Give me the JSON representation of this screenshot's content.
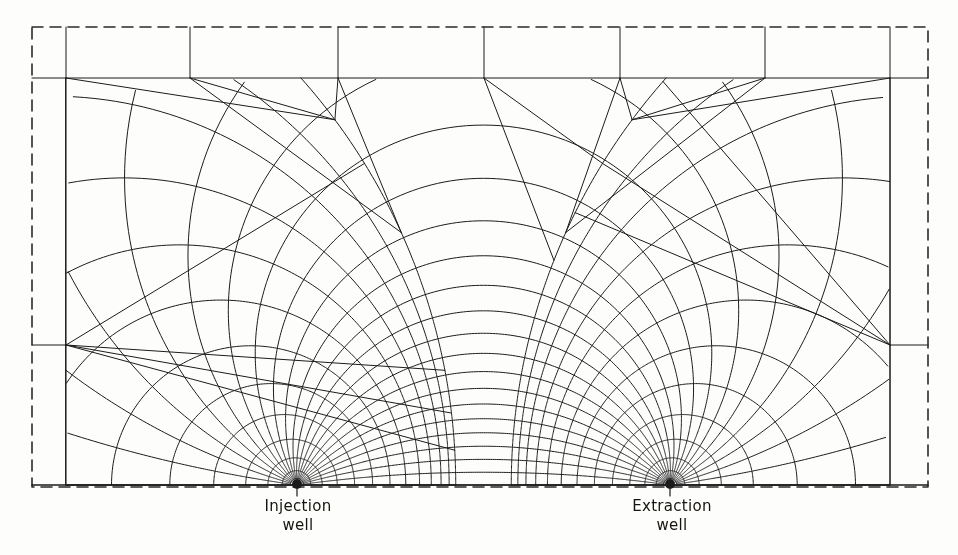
{
  "figure": {
    "kind": "flow-net-finite-element-mesh",
    "background_color": "#fdfdfc",
    "line_color": "#1b1b1b",
    "dashed_boundary_color": "#2a2a2a"
  },
  "labels": {
    "injection": {
      "line1": "Injection",
      "line2": "well"
    },
    "extraction": {
      "line1": "Extraction",
      "line2": "well"
    }
  },
  "chart_data": {
    "type": "diagram",
    "title": "",
    "geometry": {
      "outer_dashed_rect": {
        "x0": 32,
        "y0": 27,
        "x1": 928,
        "y1": 487
      },
      "inner_solid_rect": {
        "x0": 66,
        "y0": 78,
        "x1": 890,
        "y1": 485
      },
      "ground_line_y": 485,
      "symmetry_axis_x": 484
    },
    "wells": [
      {
        "name": "injection",
        "x": 297,
        "y": 484,
        "marker": "filled-dot",
        "radius": 5,
        "tick_below": true
      },
      {
        "name": "extraction",
        "x": 670,
        "y": 484,
        "marker": "filled-dot",
        "radius": 5,
        "tick_below": true
      }
    ],
    "mesh": {
      "coordinate_system": "bipolar",
      "pole_half_separation_px": 186.5,
      "radial_spokes_per_well": 22,
      "concentric_arcs_per_well": 13,
      "transition_band": true,
      "outer_frame_verticals_x": [
        66,
        190,
        338,
        484,
        620,
        765,
        890
      ],
      "outer_frame_horizontals_y": [
        78,
        345,
        485
      ]
    }
  }
}
